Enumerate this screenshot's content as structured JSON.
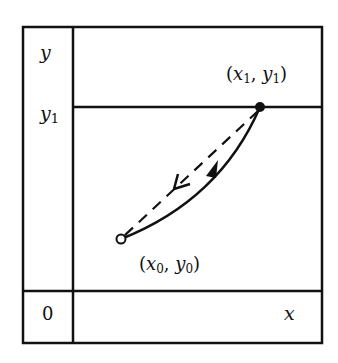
{
  "diagram": {
    "axis_labels": {
      "y": "y",
      "y1_base": "y",
      "y1_sub": "1",
      "origin": "0",
      "x": "x"
    },
    "points": {
      "end": {
        "label_open": "(",
        "x": "x",
        "x_sub": "1",
        "sep": ", ",
        "y": "y",
        "y_sub": "1",
        "label_close": ")",
        "marker": "filled-dot"
      },
      "start": {
        "label_open": "(",
        "x": "x",
        "x_sub": "0",
        "sep": ", ",
        "y": "y",
        "y_sub": "0",
        "label_close": ")",
        "marker": "open-circle"
      }
    },
    "paths": [
      {
        "name": "forward-path",
        "style": "solid",
        "direction": "start-to-end"
      },
      {
        "name": "return-path",
        "style": "dashed",
        "direction": "end-to-start"
      }
    ],
    "colors": {
      "ink": "#111111",
      "background": "#ffffff"
    }
  }
}
